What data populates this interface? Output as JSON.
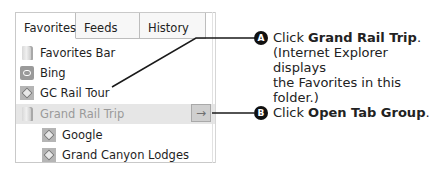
{
  "favorites_panel": {
    "tabs": [
      {
        "label": "Favorites",
        "active": true
      },
      {
        "label": "Feeds",
        "active": false
      },
      {
        "label": "History",
        "active": false
      }
    ],
    "items": [
      {
        "label": "Favorites Bar",
        "icon": "folder-icon",
        "level": 0
      },
      {
        "label": "Bing",
        "icon": "bing-icon",
        "level": 0
      },
      {
        "label": "GC Rail Tour",
        "icon": "site-icon",
        "level": 0
      },
      {
        "label": "Grand Rail Trip",
        "icon": "folder-icon",
        "level": 0,
        "selected": true
      },
      {
        "label": "Google",
        "icon": "site-icon",
        "level": 1
      },
      {
        "label": "Grand Canyon Lodges",
        "icon": "site-icon",
        "level": 1
      }
    ],
    "open_tab_group_button": {
      "glyph": "→"
    }
  },
  "callouts": [
    {
      "badge": "A",
      "prefix": "Click ",
      "bold": "Grand Rail Trip",
      "suffix": ".",
      "line2": "(Internet Explorer displays",
      "line3": "the Favorites in this folder.)"
    },
    {
      "badge": "B",
      "prefix": "Click ",
      "bold": "Open Tab Group",
      "suffix": "."
    }
  ]
}
